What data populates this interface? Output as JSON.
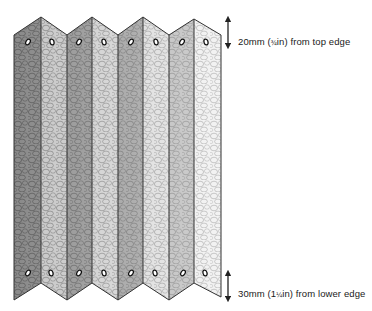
{
  "figure": {
    "panel_count": 8,
    "annotations": [
      {
        "id": "top",
        "value": "20",
        "unit": "mm",
        "imperial_whole": "",
        "imperial_frac": "¾",
        "imperial_unit": "in",
        "text": "from top edge",
        "full_text": "20mm (¾in) from top edge"
      },
      {
        "id": "bottom",
        "value": "30",
        "unit": "mm",
        "imperial_whole": "1",
        "imperial_frac": "¼",
        "imperial_unit": "in",
        "text": "from lower edge",
        "full_text": "30mm (1¼in) from lower edge"
      }
    ],
    "colors": {
      "outline": "#333333",
      "arrow": "#222222",
      "hole": "#111111",
      "panel_dark": [
        "#8a8a8a",
        "#939393",
        "#9a9a9a",
        "#b4b4b4"
      ],
      "panel_light": [
        "#c8c8c8",
        "#cfcfcf",
        "#dadada",
        "#ececec"
      ]
    },
    "icons": {
      "top_arrow": "double-headed-vertical-arrow",
      "bottom_arrow": "double-headed-vertical-arrow"
    }
  }
}
